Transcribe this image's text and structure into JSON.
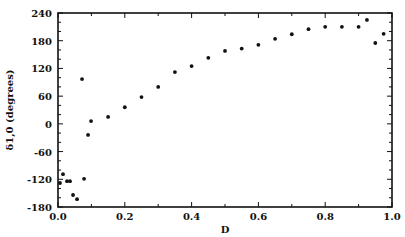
{
  "chart_data": {
    "type": "scatter",
    "title": "",
    "xlabel": "D",
    "ylabel": "δ1,0 (degrees)",
    "xlim": [
      0.0,
      1.0
    ],
    "ylim": [
      -180,
      240
    ],
    "x_ticks": [
      "0.0",
      "0.2",
      "0.4",
      "0.6",
      "0.8",
      "1.0"
    ],
    "y_ticks": [
      "240",
      "180",
      "120",
      "60",
      "0",
      "-60",
      "-120",
      "-180"
    ],
    "grid": false,
    "legend": null,
    "series": [
      {
        "name": "phase shift",
        "points": [
          [
            0.006,
            -128
          ],
          [
            0.015,
            -109
          ],
          [
            0.027,
            -124
          ],
          [
            0.036,
            -124
          ],
          [
            0.045,
            -154
          ],
          [
            0.057,
            -163
          ],
          [
            0.072,
            97
          ],
          [
            0.078,
            -119
          ],
          [
            0.09,
            -24
          ],
          [
            0.099,
            6
          ],
          [
            0.15,
            15
          ],
          [
            0.2,
            36
          ],
          [
            0.25,
            58
          ],
          [
            0.3,
            80
          ],
          [
            0.35,
            112
          ],
          [
            0.4,
            125
          ],
          [
            0.45,
            143
          ],
          [
            0.5,
            158
          ],
          [
            0.55,
            163
          ],
          [
            0.6,
            171
          ],
          [
            0.65,
            184
          ],
          [
            0.7,
            194
          ],
          [
            0.75,
            205
          ],
          [
            0.8,
            210
          ],
          [
            0.85,
            210
          ],
          [
            0.9,
            210
          ],
          [
            0.925,
            225
          ],
          [
            0.95,
            175
          ],
          [
            0.975,
            195
          ]
        ]
      }
    ]
  }
}
